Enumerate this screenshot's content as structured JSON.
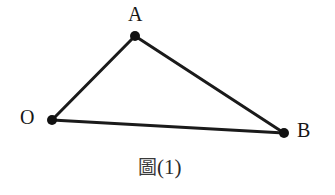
{
  "figure": {
    "canvas": {
      "width": 335,
      "height": 195,
      "background": "#ffffff"
    },
    "style": {
      "line_color": "#1a1a1a",
      "line_width": 3,
      "point_color": "#111111",
      "point_radius": 5,
      "label_color": "#161616",
      "caption_color": "#2a2a2a"
    },
    "points": [
      {
        "id": "A",
        "label": "A",
        "x": 135,
        "y": 36,
        "label_x": 128,
        "label_y": 4
      },
      {
        "id": "O",
        "label": "O",
        "x": 52,
        "y": 120,
        "label_x": 20,
        "label_y": 107
      },
      {
        "id": "B",
        "label": "B",
        "x": 284,
        "y": 133,
        "label_x": 297,
        "label_y": 120
      }
    ],
    "edges": [
      {
        "id": "OA",
        "from": "O",
        "to": "A",
        "x1": 52,
        "y1": 120,
        "x2": 135,
        "y2": 36
      },
      {
        "id": "AB",
        "from": "A",
        "to": "B",
        "x1": 135,
        "y1": 36,
        "x2": 284,
        "y2": 133
      },
      {
        "id": "OB",
        "from": "O",
        "to": "B",
        "x1": 52,
        "y1": 120,
        "x2": 284,
        "y2": 133
      }
    ],
    "caption": {
      "cjk": "圖",
      "number": "(1)",
      "full": "圖(1)",
      "x": 138,
      "y": 160
    }
  }
}
